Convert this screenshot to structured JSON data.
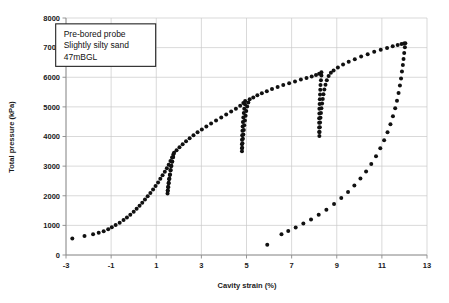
{
  "chart_data": {
    "type": "scatter",
    "title": "",
    "xlabel": "Cavity strain (%)",
    "ylabel": "Total pressure (kPa)",
    "xlim": [
      -3,
      13
    ],
    "ylim": [
      0,
      8000
    ],
    "xticks": [
      -3,
      -1,
      1,
      3,
      5,
      7,
      9,
      11,
      13
    ],
    "xtick_labels": [
      "-3",
      "-1",
      "1",
      "3",
      "5",
      "7",
      "9",
      "11",
      "13"
    ],
    "yticks": [
      0,
      1000,
      2000,
      3000,
      4000,
      5000,
      6000,
      7000,
      8000
    ],
    "ytick_labels": [
      "0",
      "1000",
      "2000",
      "3000",
      "4000",
      "5000",
      "6000",
      "7000",
      "8000"
    ],
    "grid": true,
    "legend": "none",
    "marker": "filled-circle",
    "marker_color": "#111111",
    "annotations": [
      {
        "name": "test-info-box",
        "lines": [
          "Pre-bored probe",
          "Slightly silty sand",
          "47mBGL"
        ],
        "x": 0.0,
        "y": 7600
      }
    ],
    "series": [
      {
        "name": "Initial loading to first unload-reload loop",
        "points": [
          [
            -2.72,
            560
          ],
          [
            -2.18,
            640
          ],
          [
            -1.8,
            700
          ],
          [
            -1.55,
            750
          ],
          [
            -1.33,
            800
          ],
          [
            -1.13,
            870
          ],
          [
            -0.97,
            940
          ],
          [
            -0.8,
            1010
          ],
          [
            -0.62,
            1090
          ],
          [
            -0.45,
            1180
          ],
          [
            -0.3,
            1270
          ],
          [
            -0.15,
            1360
          ],
          [
            0.0,
            1460
          ],
          [
            0.13,
            1560
          ],
          [
            0.26,
            1660
          ],
          [
            0.38,
            1760
          ],
          [
            0.5,
            1870
          ],
          [
            0.62,
            1980
          ],
          [
            0.74,
            2090
          ],
          [
            0.86,
            2210
          ],
          [
            0.97,
            2330
          ],
          [
            1.08,
            2450
          ],
          [
            1.18,
            2570
          ],
          [
            1.28,
            2690
          ],
          [
            1.38,
            2810
          ],
          [
            1.47,
            2930
          ],
          [
            1.55,
            3050
          ],
          [
            1.63,
            3170
          ],
          [
            1.7,
            3290
          ],
          [
            1.76,
            3400
          ]
        ]
      },
      {
        "name": "Unload-reload loop 1",
        "points": [
          [
            1.74,
            3300
          ],
          [
            1.7,
            3150
          ],
          [
            1.66,
            3000
          ],
          [
            1.63,
            2850
          ],
          [
            1.6,
            2700
          ],
          [
            1.57,
            2560
          ],
          [
            1.55,
            2420
          ],
          [
            1.53,
            2290
          ],
          [
            1.51,
            2170
          ],
          [
            1.5,
            2080
          ],
          [
            1.51,
            2180
          ],
          [
            1.53,
            2300
          ],
          [
            1.55,
            2440
          ],
          [
            1.58,
            2580
          ],
          [
            1.61,
            2720
          ],
          [
            1.64,
            2870
          ],
          [
            1.67,
            3010
          ],
          [
            1.71,
            3160
          ],
          [
            1.75,
            3310
          ],
          [
            1.79,
            3450
          ]
        ]
      },
      {
        "name": "Loading from loop 1 to loop 2",
        "points": [
          [
            1.9,
            3540
          ],
          [
            2.03,
            3640
          ],
          [
            2.17,
            3740
          ],
          [
            2.32,
            3840
          ],
          [
            2.48,
            3940
          ],
          [
            2.65,
            4040
          ],
          [
            2.83,
            4140
          ],
          [
            3.02,
            4240
          ],
          [
            3.22,
            4340
          ],
          [
            3.43,
            4440
          ],
          [
            3.65,
            4540
          ],
          [
            3.88,
            4640
          ],
          [
            4.1,
            4740
          ],
          [
            4.32,
            4840
          ],
          [
            4.53,
            4940
          ],
          [
            4.72,
            5040
          ],
          [
            4.86,
            5130
          ],
          [
            4.94,
            5200
          ]
        ]
      },
      {
        "name": "Unload-reload loop 2",
        "points": [
          [
            4.93,
            5090
          ],
          [
            4.9,
            4940
          ],
          [
            4.88,
            4790
          ],
          [
            4.86,
            4640
          ],
          [
            4.84,
            4490
          ],
          [
            4.83,
            4340
          ],
          [
            4.82,
            4190
          ],
          [
            4.81,
            4040
          ],
          [
            4.8,
            3890
          ],
          [
            4.8,
            3740
          ],
          [
            4.8,
            3600
          ],
          [
            4.8,
            3500
          ],
          [
            4.81,
            3620
          ],
          [
            4.82,
            3770
          ],
          [
            4.84,
            3920
          ],
          [
            4.86,
            4070
          ],
          [
            4.88,
            4220
          ],
          [
            4.9,
            4380
          ],
          [
            4.93,
            4540
          ],
          [
            4.96,
            4700
          ],
          [
            4.99,
            4860
          ],
          [
            5.03,
            5010
          ],
          [
            5.08,
            5150
          ],
          [
            5.14,
            5260
          ]
        ]
      },
      {
        "name": "Loading from loop 2 to loop 3",
        "points": [
          [
            5.3,
            5320
          ],
          [
            5.48,
            5390
          ],
          [
            5.68,
            5460
          ],
          [
            5.9,
            5530
          ],
          [
            6.13,
            5600
          ],
          [
            6.38,
            5670
          ],
          [
            6.63,
            5735
          ],
          [
            6.89,
            5800
          ],
          [
            7.15,
            5860
          ],
          [
            7.41,
            5920
          ],
          [
            7.66,
            5975
          ],
          [
            7.89,
            6025
          ],
          [
            8.08,
            6075
          ],
          [
            8.22,
            6120
          ],
          [
            8.32,
            6165
          ]
        ]
      },
      {
        "name": "Unload-reload loop 3",
        "points": [
          [
            8.32,
            6060
          ],
          [
            8.3,
            5900
          ],
          [
            8.28,
            5740
          ],
          [
            8.27,
            5580
          ],
          [
            8.26,
            5420
          ],
          [
            8.25,
            5260
          ],
          [
            8.24,
            5100
          ],
          [
            8.23,
            4940
          ],
          [
            8.23,
            4780
          ],
          [
            8.22,
            4620
          ],
          [
            8.22,
            4460
          ],
          [
            8.22,
            4300
          ],
          [
            8.22,
            4150
          ],
          [
            8.23,
            4020
          ],
          [
            8.24,
            4150
          ],
          [
            8.25,
            4310
          ],
          [
            8.26,
            4470
          ],
          [
            8.28,
            4630
          ],
          [
            8.3,
            4790
          ],
          [
            8.32,
            4950
          ],
          [
            8.35,
            5110
          ],
          [
            8.38,
            5270
          ],
          [
            8.41,
            5430
          ],
          [
            8.45,
            5590
          ],
          [
            8.5,
            5750
          ],
          [
            8.56,
            5900
          ],
          [
            8.64,
            6040
          ],
          [
            8.74,
            6150
          ],
          [
            8.86,
            6230
          ]
        ]
      },
      {
        "name": "Loading to peak pressure",
        "points": [
          [
            9.05,
            6330
          ],
          [
            9.28,
            6430
          ],
          [
            9.53,
            6520
          ],
          [
            9.8,
            6610
          ],
          [
            10.08,
            6700
          ],
          [
            10.37,
            6780
          ],
          [
            10.66,
            6860
          ],
          [
            10.95,
            6930
          ],
          [
            11.23,
            6990
          ],
          [
            11.48,
            7050
          ],
          [
            11.7,
            7090
          ],
          [
            11.87,
            7120
          ],
          [
            11.98,
            7140
          ],
          [
            12.04,
            7150
          ]
        ]
      },
      {
        "name": "Final unloading branch",
        "points": [
          [
            12.02,
            7010
          ],
          [
            11.99,
            6820
          ],
          [
            11.96,
            6620
          ],
          [
            11.93,
            6410
          ],
          [
            11.89,
            6190
          ],
          [
            11.85,
            5960
          ],
          [
            11.8,
            5720
          ],
          [
            11.74,
            5470
          ],
          [
            11.67,
            5210
          ],
          [
            11.59,
            4950
          ],
          [
            11.49,
            4680
          ],
          [
            11.38,
            4410
          ],
          [
            11.25,
            4140
          ],
          [
            11.1,
            3870
          ],
          [
            10.93,
            3600
          ],
          [
            10.74,
            3330
          ],
          [
            10.53,
            3070
          ],
          [
            10.3,
            2820
          ],
          [
            10.05,
            2580
          ],
          [
            9.78,
            2350
          ],
          [
            9.5,
            2130
          ],
          [
            9.2,
            1920
          ],
          [
            8.88,
            1720
          ],
          [
            8.54,
            1530
          ],
          [
            8.2,
            1360
          ],
          [
            7.86,
            1200
          ],
          [
            7.52,
            1060
          ],
          [
            7.18,
            930
          ],
          [
            6.85,
            810
          ],
          [
            6.55,
            700
          ],
          [
            5.92,
            350
          ]
        ]
      }
    ]
  }
}
